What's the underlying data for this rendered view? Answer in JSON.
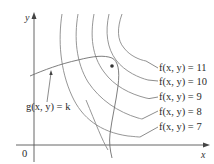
{
  "diagram": {
    "axes": {
      "x_label": "x",
      "y_label": "y",
      "origin_label": "0"
    },
    "level_curves": [
      {
        "label": "f(x, y) = 11",
        "value": 11
      },
      {
        "label": "f(x, y) = 10",
        "value": 10
      },
      {
        "label": "f(x, y) = 9",
        "value": 9
      },
      {
        "label": "f(x, y) = 8",
        "value": 8
      },
      {
        "label": "f(x, y) = 7",
        "value": 7
      }
    ],
    "constraint_curve": {
      "label": "g(x, y) = k"
    },
    "tangency_point": {
      "description": "point where g(x, y) = k touches f(x, y) = 10"
    },
    "colors": {
      "curves": "#8a8a8a",
      "axes": "#555555",
      "text": "#2a2a2a"
    }
  }
}
